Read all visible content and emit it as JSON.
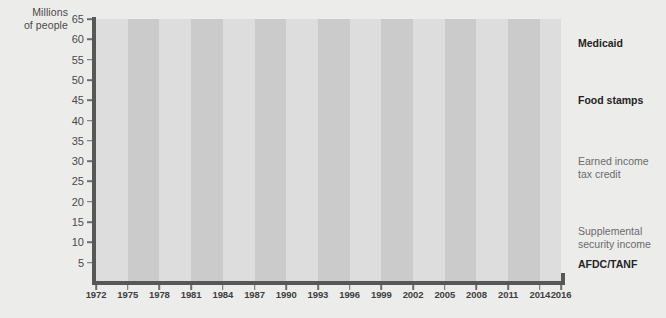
{
  "axis": {
    "y_title": "Millions\nof people",
    "y_ticks": [
      "65",
      "60",
      "55",
      "50",
      "45",
      "40",
      "35",
      "30",
      "25",
      "20",
      "15",
      "10",
      "5"
    ],
    "x_ticks": [
      "1972",
      "1975",
      "1978",
      "1981",
      "1984",
      "1987",
      "1990",
      "1993",
      "1996",
      "1999",
      "2002",
      "2005",
      "2008",
      "2011",
      "2014",
      "2016"
    ]
  },
  "series_labels": {
    "medicaid": "Medicaid",
    "food_stamps": "Food stamps",
    "eitc": "Earned income\ntax credit",
    "ssi": "Supplemental\nsecurity income",
    "afdc": "AFDC/TANF"
  },
  "colors": {
    "background": "#ececeb",
    "band_light": "#dddddd",
    "band_dark": "#cbcbcb",
    "axis": "#575757",
    "medicaid": "#3b3b3b",
    "food_stamps": "#6e6e6e",
    "eitc": "#8d8d8d",
    "ssi": "#6e6e6e",
    "afdc": "#1c1c1c",
    "tick_text": "#4a4a4a",
    "label_bold": "#242424",
    "label_mid": "#6b6b6b"
  },
  "chart_data": {
    "type": "line",
    "title": "",
    "subtitle": "",
    "xlabel": "",
    "ylabel": "Millions of people",
    "xlim": [
      1972,
      2016
    ],
    "ylim": [
      0,
      65
    ],
    "grid": false,
    "legend_position": "right-inline",
    "band_shading": "alternating vertical gray bands, 3-year width",
    "x": [
      1972,
      1973,
      1974,
      1975,
      1976,
      1977,
      1978,
      1979,
      1980,
      1981,
      1982,
      1983,
      1984,
      1985,
      1986,
      1987,
      1988,
      1989,
      1990,
      1991,
      1992,
      1993,
      1994,
      1995,
      1996,
      1997,
      1998,
      1999,
      2000,
      2001,
      2002,
      2003,
      2004,
      2005,
      2006,
      2007,
      2008,
      2009,
      2010,
      2011,
      2012,
      2013,
      2014,
      2015
    ],
    "series": [
      {
        "name": "Medicaid",
        "color": "#3b3b3b",
        "values": [
          17.6,
          19.6,
          21.5,
          22.0,
          22.8,
          22.8,
          21.9,
          21.5,
          21.6,
          22.0,
          21.6,
          21.6,
          21.6,
          21.8,
          22.5,
          23.1,
          22.9,
          23.5,
          25.3,
          28.3,
          30.9,
          33.4,
          33.4,
          33.4,
          33.2,
          32.1,
          31.0,
          31.9,
          33.7,
          36.6,
          40.1,
          42.7,
          43.7,
          45.4,
          46.7,
          45.9,
          47.1,
          51.0,
          56.0,
          57.5,
          57.9,
          62.6,
          65.0,
          58.0
        ]
      },
      {
        "name": "Food stamps",
        "color": "#6e6e6e",
        "values": [
          11.1,
          12.2,
          12.9,
          17.1,
          18.5,
          17.0,
          16.0,
          17.7,
          21.1,
          22.4,
          22.0,
          21.6,
          20.9,
          19.9,
          19.4,
          19.1,
          18.7,
          18.8,
          20.0,
          22.6,
          25.4,
          27.0,
          27.5,
          26.6,
          25.5,
          22.9,
          19.8,
          18.2,
          17.2,
          17.3,
          19.1,
          21.3,
          23.9,
          25.7,
          26.5,
          26.3,
          28.2,
          33.5,
          40.3,
          44.7,
          46.6,
          47.6,
          46.5,
          45.8
        ]
      },
      {
        "name": "Earned income tax credit",
        "color": "#8d8d8d",
        "values": [
          0.0,
          0.0,
          0.0,
          6.2,
          6.5,
          5.6,
          5.2,
          7.1,
          6.9,
          6.7,
          6.4,
          7.4,
          6.4,
          7.4,
          7.2,
          8.7,
          11.1,
          11.7,
          12.5,
          13.7,
          14.1,
          15.1,
          19.0,
          19.3,
          19.5,
          19.4,
          20.3,
          19.3,
          19.3,
          19.6,
          21.7,
          22.0,
          22.3,
          22.8,
          23.0,
          24.6,
          24.8,
          27.0,
          27.4,
          27.9,
          27.8,
          28.0,
          28.0,
          28.0
        ]
      },
      {
        "name": "Supplemental security income",
        "color": "#6e6e6e",
        "values": [
          0.0,
          0.0,
          3.2,
          4.3,
          4.2,
          4.2,
          4.2,
          4.1,
          4.1,
          4.0,
          3.9,
          3.9,
          4.0,
          4.1,
          4.2,
          4.4,
          4.5,
          4.6,
          4.8,
          5.1,
          5.6,
          6.0,
          6.3,
          6.5,
          6.6,
          6.5,
          6.6,
          6.6,
          6.6,
          6.7,
          6.8,
          6.9,
          6.9,
          7.1,
          7.2,
          7.4,
          7.5,
          7.7,
          7.9,
          8.1,
          8.3,
          8.4,
          8.3,
          8.4
        ]
      },
      {
        "name": "AFDC/TANF",
        "color": "#1c1c1c",
        "values": [
          3.0,
          3.2,
          3.2,
          3.5,
          3.6,
          3.6,
          3.5,
          3.5,
          3.7,
          3.8,
          3.6,
          3.7,
          3.7,
          3.7,
          3.7,
          3.8,
          3.7,
          3.8,
          4.1,
          4.5,
          4.8,
          5.0,
          5.0,
          4.9,
          4.6,
          4.0,
          3.2,
          2.6,
          2.3,
          2.1,
          2.1,
          2.1,
          2.1,
          2.0,
          1.9,
          1.8,
          1.7,
          1.8,
          1.9,
          1.9,
          1.8,
          1.7,
          1.7,
          1.6
        ]
      }
    ]
  }
}
